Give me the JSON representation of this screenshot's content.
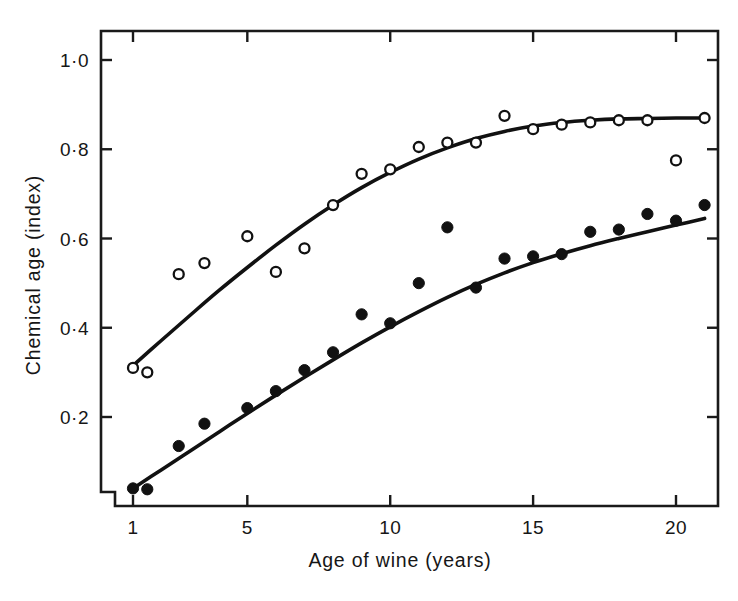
{
  "chart_data": {
    "type": "scatter",
    "title": "",
    "subtitle": "",
    "xlabel": "Age of wine (years)",
    "ylabel": "Chemical age (index)",
    "xlim": [
      0.2,
      21.8
    ],
    "ylim": [
      0.0,
      1.07
    ],
    "grid": false,
    "legend_position": "none",
    "xticks": [
      1,
      5,
      10,
      15,
      20
    ],
    "xticklabels": [
      "1",
      "5",
      "10",
      "15",
      "20"
    ],
    "yticks": [
      0.2,
      0.4,
      0.6,
      0.8,
      1.0
    ],
    "yticklabels": [
      "0·2",
      "0·4",
      "0·6",
      "0·8",
      "1·0"
    ],
    "axis_style": "box-frame-with-mirrored-ticks",
    "marker_colors": {
      "open": "#ffffff",
      "filled": "#111111",
      "outline": "#111111",
      "curve": "#111111",
      "axis": "#1a1a1a"
    },
    "series": [
      {
        "name": "open-circles",
        "marker": "open circle",
        "x": [
          1.0,
          1.5,
          2.6,
          3.5,
          5.0,
          6.0,
          7.0,
          8.0,
          9.0,
          10.0,
          11.0,
          12.0,
          13.0,
          14.0,
          15.0,
          16.0,
          17.0,
          18.0,
          19.0,
          20.0,
          21.0
        ],
        "y": [
          0.31,
          0.3,
          0.52,
          0.545,
          0.605,
          0.525,
          0.578,
          0.675,
          0.745,
          0.755,
          0.805,
          0.815,
          0.815,
          0.875,
          0.845,
          0.855,
          0.86,
          0.865,
          0.865,
          0.775,
          0.87
        ],
        "fit_curve": {
          "x": [
            1.0,
            2.0,
            3.0,
            4.0,
            5.0,
            6.0,
            7.0,
            8.0,
            9.0,
            10.0,
            11.0,
            12.0,
            13.0,
            14.0,
            15.0,
            16.0,
            17.0,
            18.0,
            19.0,
            20.0,
            21.0
          ],
          "y": [
            0.315,
            0.372,
            0.428,
            0.483,
            0.535,
            0.585,
            0.632,
            0.675,
            0.714,
            0.748,
            0.778,
            0.803,
            0.824,
            0.84,
            0.852,
            0.86,
            0.865,
            0.868,
            0.869,
            0.87,
            0.87
          ]
        }
      },
      {
        "name": "filled-circles",
        "marker": "filled circle",
        "x": [
          1.0,
          1.5,
          2.6,
          3.5,
          5.0,
          6.0,
          7.0,
          8.0,
          9.0,
          10.0,
          11.0,
          12.0,
          13.0,
          14.0,
          15.0,
          16.0,
          17.0,
          18.0,
          19.0,
          20.0,
          21.0
        ],
        "y": [
          0.04,
          0.038,
          0.135,
          0.185,
          0.22,
          0.258,
          0.305,
          0.345,
          0.43,
          0.41,
          0.5,
          0.625,
          0.49,
          0.555,
          0.56,
          0.565,
          0.615,
          0.62,
          0.655,
          0.64,
          0.675
        ],
        "fit_curve": {
          "x": [
            1.0,
            2.0,
            3.0,
            4.0,
            5.0,
            6.0,
            7.0,
            8.0,
            9.0,
            10.0,
            11.0,
            12.0,
            13.0,
            14.0,
            15.0,
            16.0,
            17.0,
            18.0,
            19.0,
            20.0,
            21.0
          ],
          "y": [
            0.04,
            0.082,
            0.124,
            0.166,
            0.208,
            0.249,
            0.289,
            0.328,
            0.366,
            0.402,
            0.436,
            0.468,
            0.497,
            0.523,
            0.546,
            0.566,
            0.584,
            0.6,
            0.615,
            0.63,
            0.645
          ]
        }
      }
    ]
  }
}
